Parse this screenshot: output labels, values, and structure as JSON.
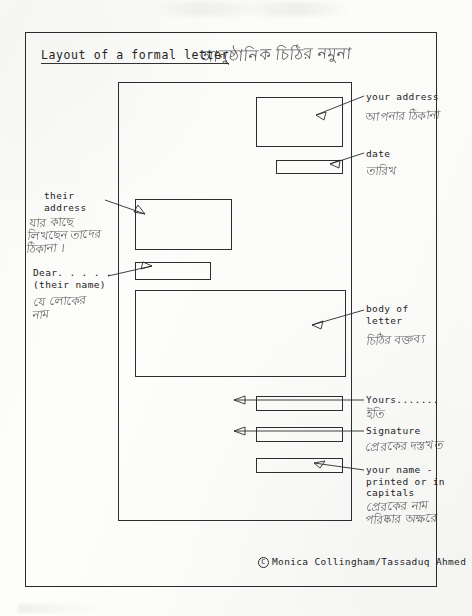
{
  "document": {
    "title_en": "Layout of a formal letter",
    "title_bn": "আনুষ্ঠানিক চিঠির নমুনা",
    "credit": "Monica Collingham/Tassaduq Ahmed",
    "copyright_symbol": "C"
  },
  "annotations": {
    "your_address": {
      "label_en": "your address",
      "label_bn": "আপনার ঠিকানা"
    },
    "date": {
      "label_en": "date",
      "label_bn": "তারিখ"
    },
    "their_address": {
      "label_en": "their\naddress",
      "label_bn": "যার কাছে\nলিখছেন তাদের\nঠিকানা ।"
    },
    "salutation": {
      "label_en": "Dear. . . . .\n(their name)",
      "label_bn": "যে লোকের\nনাম"
    },
    "body": {
      "label_en": "body of\nletter",
      "label_bn": "চিঠির বক্তব্য"
    },
    "yours": {
      "label_en": "Yours.......",
      "label_bn": "ইতি"
    },
    "signature": {
      "label_en": "Signature",
      "label_bn": "প্রেরকের দস্তখত"
    },
    "your_name": {
      "label_en": "your name -\nprinted or in\ncapitals",
      "label_bn": "প্রেরকের নাম\nপরিষ্কার অক্ষরে"
    }
  },
  "letter_boxes": [
    {
      "name": "your-address-box",
      "left": 137,
      "top": 14,
      "width": 87,
      "height": 50
    },
    {
      "name": "date-box",
      "left": 157,
      "top": 77,
      "width": 67,
      "height": 14
    },
    {
      "name": "their-address-box",
      "left": 16,
      "top": 116,
      "width": 97,
      "height": 51
    },
    {
      "name": "salutation-box",
      "left": 16,
      "top": 179,
      "width": 76,
      "height": 18
    },
    {
      "name": "body-box",
      "left": 16,
      "top": 207,
      "width": 211,
      "height": 87
    },
    {
      "name": "yours-box",
      "left": 137,
      "top": 313,
      "width": 87,
      "height": 15
    },
    {
      "name": "signature-box",
      "left": 137,
      "top": 344,
      "width": 87,
      "height": 15
    },
    {
      "name": "your-name-box",
      "left": 137,
      "top": 375,
      "width": 87,
      "height": 15
    }
  ]
}
